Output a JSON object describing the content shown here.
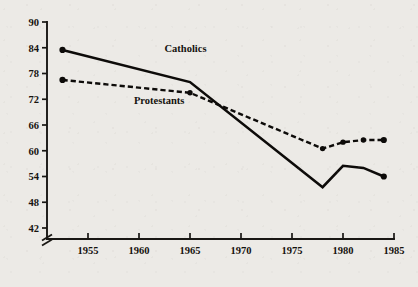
{
  "chart_data": {
    "type": "line",
    "title": "",
    "subtitle": "",
    "xlabel": "",
    "ylabel": "",
    "xlim": [
      1951,
      1986
    ],
    "ylim": [
      42,
      90
    ],
    "y_axis_break": true,
    "y_axis_break_note": "axis broken below 42",
    "grid": false,
    "legend_position": "inline-annotation",
    "x_ticks": [
      1955,
      1960,
      1965,
      1970,
      1975,
      1980,
      1985
    ],
    "x_tick_labels": [
      "1955",
      "1960",
      "1965",
      "1970",
      "1975",
      "1980",
      "1985"
    ],
    "y_ticks": [
      42,
      48,
      54,
      60,
      66,
      72,
      78,
      84,
      90
    ],
    "y_tick_labels": [
      "42",
      "48",
      "54",
      "60",
      "66",
      "72",
      "78",
      "84",
      "90"
    ],
    "series": [
      {
        "name": "Catholics",
        "style": "solid",
        "marker": "filled-circle",
        "x": [
          1952.5,
          1965,
          1978,
          1980,
          1982,
          1984
        ],
        "values": [
          83.5,
          76.0,
          51.5,
          56.5,
          56.0,
          54.0
        ],
        "label_x": 1962.5,
        "label_y": 83.0
      },
      {
        "name": "Protestants",
        "style": "dashed",
        "marker": "filled-circle",
        "x": [
          1952.5,
          1965,
          1978,
          1980,
          1982,
          1984
        ],
        "values": [
          76.5,
          73.5,
          60.5,
          62.0,
          62.5,
          62.5
        ],
        "label_x": 1959.5,
        "label_y": 71.0
      }
    ],
    "annotations": [
      {
        "text": "Catholics",
        "x": 1962.5,
        "y": 83.0
      },
      {
        "text": "Protestants",
        "x": 1959.5,
        "y": 71.0
      }
    ],
    "colors": {
      "line": "#0d0b09",
      "text": "#16130f",
      "background": "#eceae6"
    }
  }
}
